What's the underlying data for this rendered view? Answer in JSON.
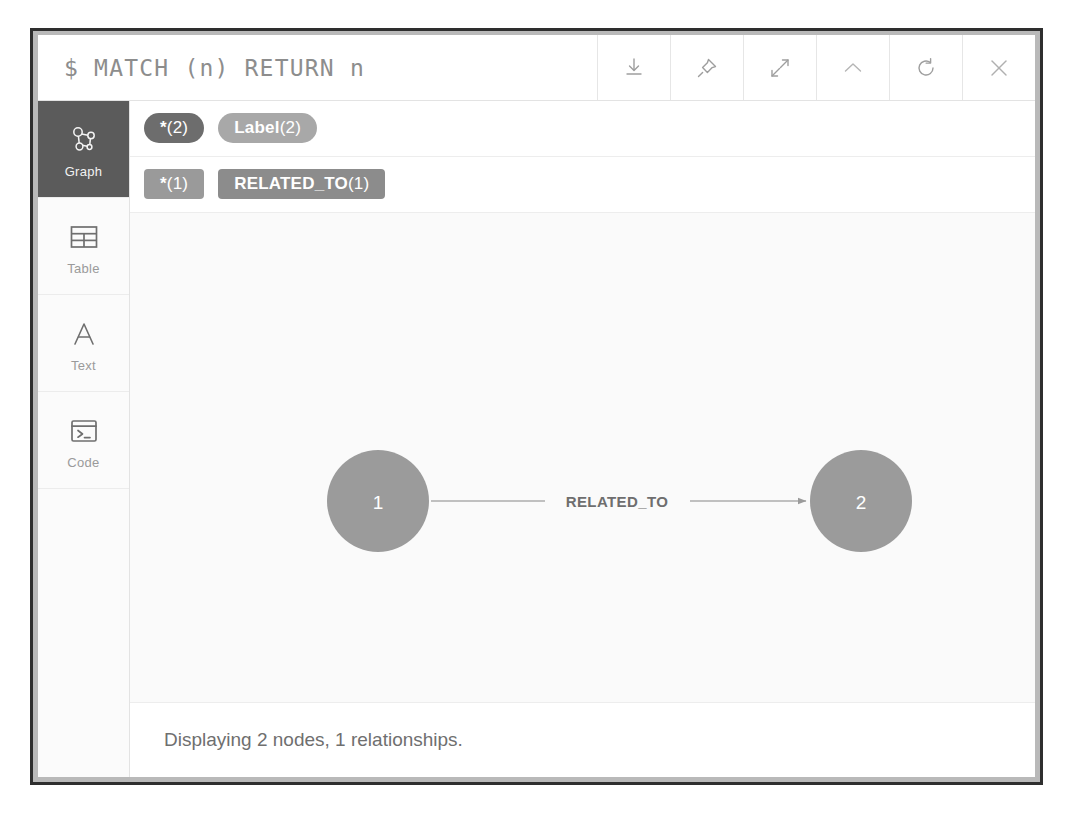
{
  "window": {
    "query": "$ MATCH (n) RETURN n"
  },
  "header": {
    "buttons": [
      {
        "name": "download-icon",
        "label": "Download"
      },
      {
        "name": "pin-icon",
        "label": "Pin"
      },
      {
        "name": "expand-icon",
        "label": "Expand"
      },
      {
        "name": "collapse-icon",
        "label": "Collapse"
      },
      {
        "name": "refresh-icon",
        "label": "Refresh"
      },
      {
        "name": "close-icon",
        "label": "Close"
      }
    ]
  },
  "sidebar": {
    "items": [
      {
        "label": "Graph",
        "icon": "graph-icon",
        "active": true
      },
      {
        "label": "Table",
        "icon": "table-icon",
        "active": false
      },
      {
        "label": "Text",
        "icon": "text-icon",
        "active": false
      },
      {
        "label": "Code",
        "icon": "code-icon",
        "active": false
      }
    ]
  },
  "legend": {
    "nodes": [
      {
        "label": "*",
        "count": "(2)",
        "color": "#6d6d6d"
      },
      {
        "label": "Label",
        "count": "(2)",
        "color": "#a8a8a8"
      }
    ],
    "relationships": [
      {
        "label": "*",
        "count": "(1)",
        "color": "#9a9a9a"
      },
      {
        "label": "RELATED_TO",
        "count": "(1)",
        "color": "#8c8c8c"
      }
    ]
  },
  "graph": {
    "node_color": "#9b9b9b",
    "edge_color": "#adadad",
    "nodes": [
      {
        "id": "1",
        "label": "1",
        "cx": 248,
        "cy": 288,
        "r": 51
      },
      {
        "id": "2",
        "label": "2",
        "cx": 731,
        "cy": 288,
        "r": 51
      }
    ],
    "relationships": [
      {
        "type": "RELATED_TO",
        "from": "1",
        "to": "2"
      }
    ]
  },
  "status": {
    "text": "Displaying 2 nodes, 1 relationships."
  }
}
